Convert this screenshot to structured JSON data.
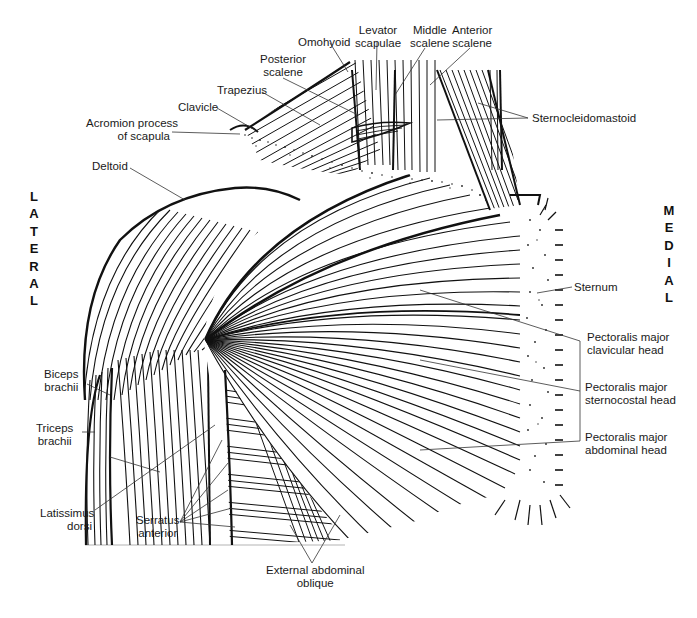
{
  "figure": {
    "orientation": {
      "left": "LATERAL",
      "right": "MEDIAL"
    },
    "labels": {
      "omohyoid": "Omohyoid",
      "levator_scapulae": [
        "Levator",
        "scapulae"
      ],
      "middle_scalene": [
        "Middle",
        "scalene"
      ],
      "anterior_scalene": [
        "Anterior",
        "scalene"
      ],
      "posterior_scalene": [
        "Posterior",
        "scalene"
      ],
      "trapezius": "Trapezius",
      "clavicle": "Clavicle",
      "acromion": [
        "Acromion process",
        "of scapula"
      ],
      "sternocleidomastoid": "Sternocleidomastoid",
      "deltoid": "Deltoid",
      "sternum": "Sternum",
      "pec_clavicular": [
        "Pectoralis major",
        "clavicular head"
      ],
      "pec_sternocostal": [
        "Pectoralis major",
        "sternocostal head"
      ],
      "pec_abdominal": [
        "Pectoralis major",
        "abdominal head"
      ],
      "biceps": [
        "Biceps",
        "brachii"
      ],
      "triceps": [
        "Triceps",
        "brachii"
      ],
      "latissimus": [
        "Latissimus",
        "dorsi"
      ],
      "serratus": [
        "Serratus",
        "anterior"
      ],
      "external_oblique": [
        "External abdominal",
        "oblique"
      ]
    },
    "colors": {
      "ink": "#111111",
      "paper": "#ffffff",
      "leader": "#333333"
    }
  }
}
